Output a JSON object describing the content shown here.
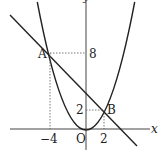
{
  "diagram": {
    "type": "coordinate-graph",
    "curves": [
      {
        "name": "parabola",
        "equation": "y = (1/2)x^2"
      },
      {
        "name": "line",
        "equation": "y = -x + 4"
      }
    ],
    "axes": {
      "x_label": "x",
      "y_label": "y",
      "origin_label": "O"
    },
    "points": [
      {
        "name": "A",
        "x": -4,
        "y": 8
      },
      {
        "name": "B",
        "x": 2,
        "y": 2
      }
    ],
    "tick_labels": {
      "x": [
        "-4",
        "2"
      ],
      "y": [
        "8",
        "2"
      ]
    },
    "labels": {
      "A": "A",
      "B": "B",
      "O": "O",
      "x_axis": "x",
      "y_axis": "y",
      "y8": "8",
      "y2": "2",
      "xm4": "−4",
      "x2": "2"
    },
    "colors": {
      "stroke": "#222222",
      "dashed": "#555555"
    }
  }
}
